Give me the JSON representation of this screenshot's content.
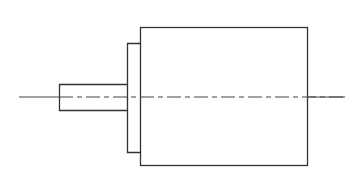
{
  "diagram": {
    "type": "technical-drawing",
    "view": "side elevation",
    "stroke_color": "#333333",
    "background": "#ffffff",
    "parts": [
      {
        "name": "shaft",
        "x": 59,
        "y": 84,
        "w": 68,
        "h": 26
      },
      {
        "name": "flange",
        "x": 127,
        "y": 43,
        "w": 13,
        "h": 109
      },
      {
        "name": "body",
        "x": 140,
        "y": 27,
        "w": 167,
        "h": 138
      }
    ],
    "centerline": {
      "x1": 19,
      "x2": 345,
      "y": 97
    }
  }
}
